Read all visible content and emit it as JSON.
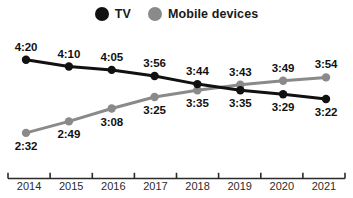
{
  "legend": {
    "entries": [
      {
        "label": "TV",
        "color": "#111111",
        "icon": "circle-marker-icon"
      },
      {
        "label": "Mobile devices",
        "color": "#8a8a8a",
        "icon": "circle-marker-icon"
      }
    ]
  },
  "axis": {
    "years": [
      "2014",
      "2015",
      "2016",
      "2017",
      "2018",
      "2019",
      "2020",
      "2021"
    ]
  },
  "chart_data": {
    "type": "line",
    "title": "",
    "subtitle": "",
    "xlabel": "",
    "ylabel": "",
    "grid": false,
    "legend_position": "top-center",
    "categories": [
      "2014",
      "2015",
      "2016",
      "2017",
      "2018",
      "2019",
      "2020",
      "2021"
    ],
    "value_format": "h:mm",
    "ylim_minutes": [
      140,
      270
    ],
    "series": [
      {
        "name": "TV",
        "color": "#111111",
        "values": [
          "4:20",
          "4:10",
          "4:05",
          "3:56",
          "3:44",
          "3:35",
          "3:29",
          "3:22"
        ],
        "values_minutes": [
          260,
          250,
          245,
          236,
          224,
          215,
          209,
          202
        ],
        "label_positions": [
          "above",
          "above",
          "above",
          "above",
          "above",
          "below",
          "below",
          "below"
        ]
      },
      {
        "name": "Mobile devices",
        "color": "#8a8a8a",
        "values": [
          "2:32",
          "2:49",
          "3:08",
          "3:25",
          "3:35",
          "3:43",
          "3:49",
          "3:54"
        ],
        "values_minutes": [
          152,
          169,
          188,
          205,
          215,
          223,
          229,
          234
        ],
        "label_positions": [
          "below",
          "below",
          "below",
          "below",
          "below",
          "above",
          "above",
          "above"
        ]
      }
    ],
    "annotations": [
      {
        "text": "lines cross between 2018 and 2019"
      }
    ]
  }
}
